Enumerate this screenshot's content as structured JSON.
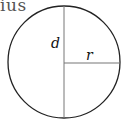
{
  "caption": "ius",
  "diagram": {
    "shape": "circle",
    "labels": {
      "diameter": "d",
      "radius": "r"
    },
    "colors": {
      "outline": "#222222",
      "lines": "#777777"
    }
  }
}
